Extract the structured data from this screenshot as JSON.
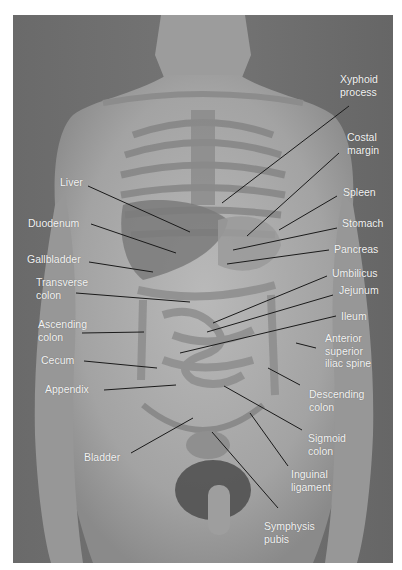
{
  "figure": {
    "colors": {
      "background": "#6f6f6f",
      "label_text": "#f4f4f4",
      "leader_line": "#1a1a1a"
    }
  },
  "labels": {
    "right": [
      {
        "id": "xyphoid-process",
        "text": "Xyphoid\nprocess"
      },
      {
        "id": "costal-margin",
        "text": "Costal\nmargin"
      },
      {
        "id": "spleen",
        "text": "Spleen"
      },
      {
        "id": "stomach",
        "text": "Stomach"
      },
      {
        "id": "pancreas",
        "text": "Pancreas"
      },
      {
        "id": "umbilicus",
        "text": "Umbilicus"
      },
      {
        "id": "jejunum",
        "text": "Jejunum"
      },
      {
        "id": "ileum",
        "text": "Ileum"
      },
      {
        "id": "anterior-superior-iliac-spine",
        "text": "Anterior\nsuperior\niliac spine"
      },
      {
        "id": "descending-colon",
        "text": "Descending\ncolon"
      },
      {
        "id": "sigmoid-colon",
        "text": "Sigmoid\ncolon"
      },
      {
        "id": "inguinal-ligament",
        "text": "Inguinal\nligament"
      },
      {
        "id": "symphysis-pubis",
        "text": "Symphysis\npubis"
      }
    ],
    "left": [
      {
        "id": "liver",
        "text": "Liver"
      },
      {
        "id": "duodenum",
        "text": "Duodenum"
      },
      {
        "id": "gallbladder",
        "text": "Gallbladder"
      },
      {
        "id": "transverse-colon",
        "text": "Transverse\ncolon"
      },
      {
        "id": "ascending-colon",
        "text": "Ascending\ncolon"
      },
      {
        "id": "cecum",
        "text": "Cecum"
      },
      {
        "id": "appendix",
        "text": "Appendix"
      },
      {
        "id": "bladder",
        "text": "Bladder"
      }
    ]
  }
}
